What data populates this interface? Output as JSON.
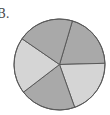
{
  "label": "B.",
  "colors": {
    "dark": "#a9a9a9",
    "light": "#d5d5d5",
    "outline": "#5a5a5a"
  },
  "geometry": {
    "cx": 59.5,
    "cy": 64.5,
    "r": 45.5,
    "start_angle_deg": 16.5
  },
  "chart_data": {
    "type": "pie",
    "title": "B.",
    "categories": [
      "Slice 1",
      "Slice 2",
      "Slice 3",
      "Slice 4",
      "Slice 5"
    ],
    "values": [
      20,
      20,
      20,
      20,
      20
    ],
    "slice_shades": [
      "dark",
      "light",
      "dark",
      "light",
      "dark"
    ],
    "start_angle_deg": 16.5,
    "direction": "clockwise",
    "legend": "none",
    "data_labels": "none"
  }
}
